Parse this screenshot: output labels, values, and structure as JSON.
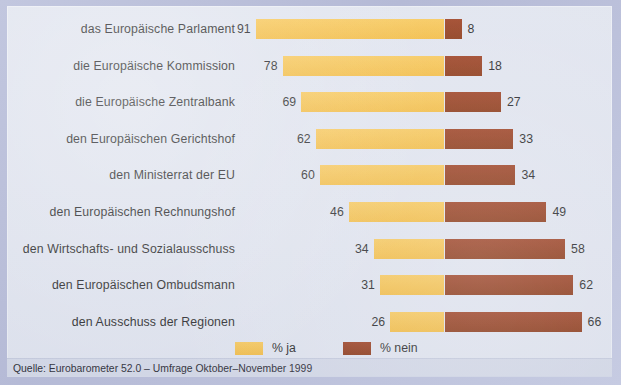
{
  "chart_data": {
    "type": "bar",
    "orientation": "horizontal",
    "layout": "diverging-paired",
    "title": "",
    "xlabel": "",
    "ylabel": "",
    "categories": [
      "das Europäische Parlament",
      "die Europäische Kommission",
      "die Europäische Zentralbank",
      "den Europäischen Gerichtshof",
      "den Ministerrat der EU",
      "den Europäischen Rechnungshof",
      "den Wirtschafts- und Sozialausschuss",
      "den Europäischen Ombudsmann",
      "den Ausschuss der Regionen"
    ],
    "series": [
      {
        "name": "% ja",
        "color": "#f5be46",
        "values": [
          91,
          78,
          69,
          62,
          60,
          46,
          34,
          31,
          26
        ]
      },
      {
        "name": "% nein",
        "color": "#8f3310",
        "values": [
          8,
          18,
          27,
          33,
          34,
          49,
          58,
          62,
          66
        ]
      }
    ],
    "value_labels_shown": true,
    "grid": false,
    "legend_position": "bottom-center",
    "axis_max": 100,
    "px_per_unit": 2.07
  },
  "legend": {
    "items": [
      {
        "label": "% ja",
        "color": "#f5be46",
        "swatch": "legend-swatch-yes"
      },
      {
        "label": "% nein",
        "color": "#8f3310",
        "swatch": "legend-swatch-no"
      }
    ]
  },
  "source": {
    "text": "Quelle: Eurobarometer 52.0 – Umfrage Oktober–November 1999"
  },
  "colors": {
    "yes": "#f5be46",
    "no": "#8f3310",
    "panel": "#dfe3ee",
    "frame": "#b8bdd9",
    "source_strip": "#d2d7e6",
    "text": "#1b1b20"
  }
}
